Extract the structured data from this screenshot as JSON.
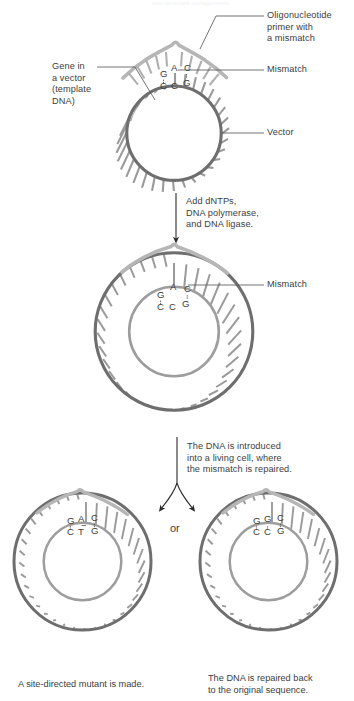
{
  "figure": {
    "title_fragment": "site-directed mutagenesis",
    "background_color": "#ffffff",
    "text_color": "#3d3d3d"
  },
  "palette": {
    "vector_strand": "#6e6e6e",
    "primer_strand": "#b3b3b3",
    "spoke_dark": "#8a8a8a",
    "spoke_light": "#b8b8b8",
    "arrow": "#2b2b2b",
    "leader_line": "#5a5a5a"
  },
  "stage1": {
    "name": "template-with-primer",
    "labels": [
      {
        "id": "oligo-primer",
        "text": "Oligonucleotide\nprimer with\na mismatch",
        "side": "right"
      },
      {
        "id": "mismatch",
        "text": "Mismatch",
        "side": "right"
      },
      {
        "id": "vector",
        "text": "Vector",
        "side": "right"
      },
      {
        "id": "gene-in-vector",
        "text": "Gene in\na vector\n(template\nDNA)",
        "side": "left"
      }
    ],
    "sequence": {
      "top_strand": [
        "G",
        "A",
        "C"
      ],
      "bottom_strand": [
        "C",
        "C",
        "G"
      ],
      "mismatch_index": 1,
      "mismatch_pair": "A·C"
    }
  },
  "step1": {
    "name": "add-enzymes",
    "text": "Add dNTPs,\nDNA polymerase,\nand DNA ligase.",
    "arrow": "down"
  },
  "stage2": {
    "name": "heteroduplex-plasmid",
    "labels": [
      {
        "id": "mismatch",
        "text": "Mismatch",
        "side": "right"
      }
    ],
    "sequence": {
      "top_strand": [
        "G",
        "A",
        "C"
      ],
      "bottom_strand": [
        "C",
        "C",
        "G"
      ],
      "mismatch_index": 1,
      "mismatch_pair": "A·C"
    }
  },
  "step2": {
    "name": "introduce-into-cell",
    "text": "The DNA is introduced\ninto a living cell, where\nthe mismatch is repaired.",
    "arrow": "branch",
    "branch_connector": "or"
  },
  "stage3_left": {
    "name": "site-directed-mutant",
    "caption": "A site-directed mutant is made.",
    "sequence": {
      "top_strand": [
        "G",
        "A",
        "C"
      ],
      "bottom_strand": [
        "C",
        "T",
        "G"
      ],
      "mismatch_index": -1
    }
  },
  "stage3_right": {
    "name": "repaired-original",
    "caption": "The DNA is repaired back\nto the original sequence.",
    "sequence": {
      "top_strand": [
        "G",
        "G",
        "C"
      ],
      "bottom_strand": [
        "C",
        "C",
        "G"
      ],
      "mismatch_index": -1
    }
  }
}
